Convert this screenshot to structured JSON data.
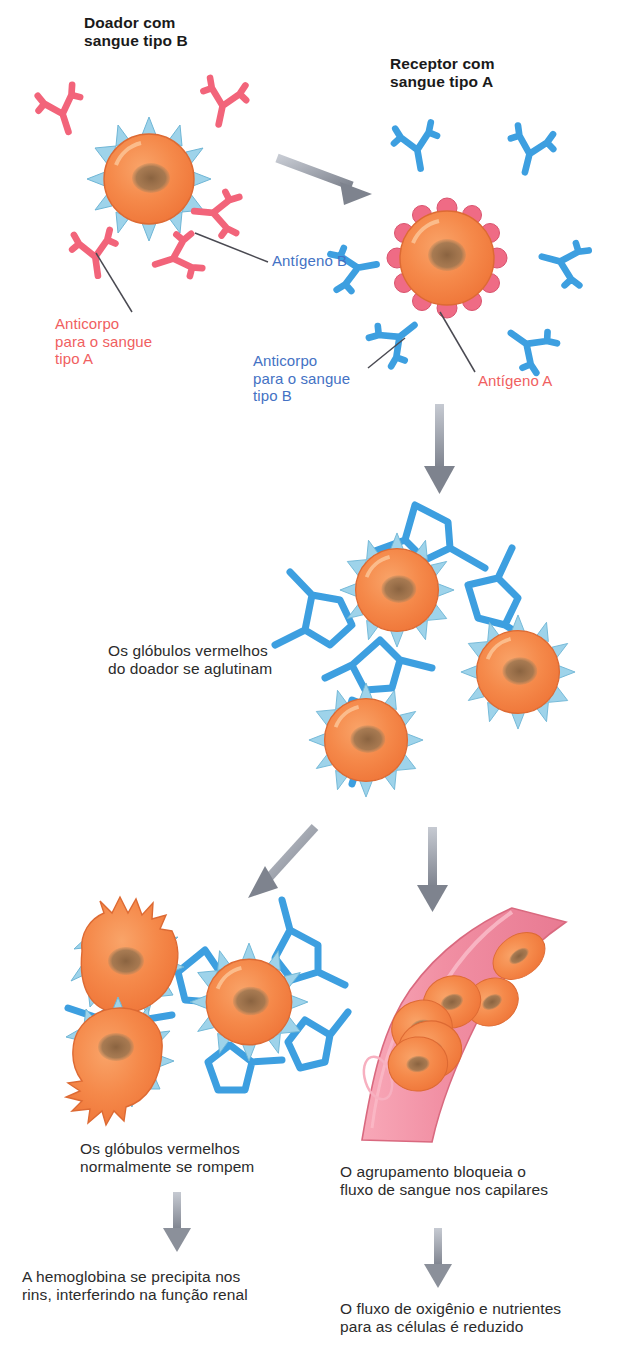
{
  "diagram": {
    "title_donor": "Doador com\nsangue tipo B",
    "title_recipient": "Receptor com\nsangue tipo A",
    "label_antigen_b": "Antígeno B",
    "label_antibody_a": "Anticorpo\npara o sangue\ntipo A",
    "label_antibody_b": "Anticorpo\npara o sangue\ntipo B",
    "label_antigen_a": "Antígeno A",
    "step_agglutinate": "Os glóbulos vermelhos\ndo doador se aglutinam",
    "step_rupture": "Os glóbulos vermelhos\nnormalmente se rompem",
    "step_blockage": "O agrupamento bloqueia o\nfluxo de sangue nos capilares",
    "step_kidney": "A hemoglobina se precipita nos\nrins, interferindo na função renal",
    "step_oxygen": "O fluxo de oxigênio e nutrientes\npara as células é reduzido"
  },
  "colors": {
    "cell_body": "#f58a4b",
    "cell_rim": "#e8703a",
    "cell_nucleus": "#8a6340",
    "antigen_b_spike": "#8ecae6",
    "antigen_a_bump": "#ef6b85",
    "antibody_a": "#f2647a",
    "antibody_b": "#3d9fe0",
    "arrow": "#8b909a",
    "capillary": "#f0889c",
    "leader_line": "#4a4a52",
    "text_dark": "#2b2b2b",
    "text_blue": "#4472c4",
    "text_red": "#f0605f",
    "background": "#ffffff"
  },
  "icons": {
    "arrow": "arrow-icon",
    "red_blood_cell": "red-blood-cell-icon",
    "antibody": "antibody-icon",
    "capillary": "capillary-icon"
  }
}
